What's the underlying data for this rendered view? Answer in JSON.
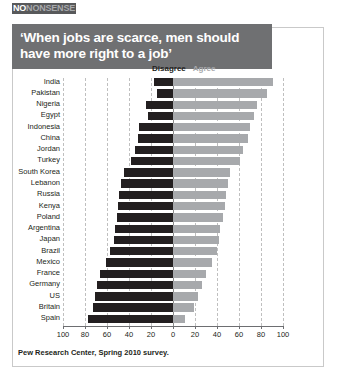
{
  "masthead": {
    "logo_bold": "NO",
    "logo_light": "NONSENSE"
  },
  "title": {
    "line1": "‘When jobs are scarce, men should",
    "line2": "have more right to a job’"
  },
  "legend": {
    "disagree": "Disagree",
    "agree": "Agree"
  },
  "source": "Pew Research Center, Spring 2010 survey.",
  "colors": {
    "disagree": "#231f20",
    "agree": "#a7a9ac",
    "banner": "#6f7072",
    "frame": "#c9c9c9",
    "grid": "#bfbfbf"
  },
  "chart_data": {
    "type": "bar",
    "orientation": "horizontal",
    "layout": "diverging",
    "title": "‘When jobs are scarce, men should have more right to a job’",
    "subtitle": "",
    "xlabel": "",
    "ylabel": "",
    "xlim": [
      -100,
      100
    ],
    "xticks": [
      -100,
      -80,
      -60,
      -40,
      -20,
      0,
      20,
      40,
      60,
      80,
      100
    ],
    "xticklabels": [
      "100",
      "80",
      "60",
      "40",
      "20",
      "0",
      "20",
      "40",
      "60",
      "80",
      "100"
    ],
    "grid": true,
    "legend_position": "top-center",
    "categories": [
      "India",
      "Pakistan",
      "Nigeria",
      "Egypt",
      "Indonesia",
      "China",
      "Jordan",
      "Turkey",
      "South Korea",
      "Lebanon",
      "Russia",
      "Kenya",
      "Poland",
      "Argentina",
      "Japan",
      "Brazil",
      "Mexico",
      "France",
      "Germany",
      "US",
      "Britain",
      "Spain"
    ],
    "series": [
      {
        "name": "Disagree",
        "color": "#231f20",
        "values": [
          17,
          15,
          25,
          23,
          31,
          32,
          35,
          38,
          45,
          47,
          49,
          50,
          51,
          53,
          54,
          57,
          61,
          66,
          69,
          71,
          73,
          77
        ]
      },
      {
        "name": "Agree",
        "color": "#a7a9ac",
        "values": [
          91,
          85,
          76,
          74,
          70,
          68,
          64,
          61,
          52,
          50,
          48,
          47,
          45,
          43,
          42,
          40,
          35,
          30,
          26,
          23,
          19,
          11
        ]
      }
    ],
    "annotations": [
      "Pew Research Center, Spring 2010 survey."
    ]
  }
}
